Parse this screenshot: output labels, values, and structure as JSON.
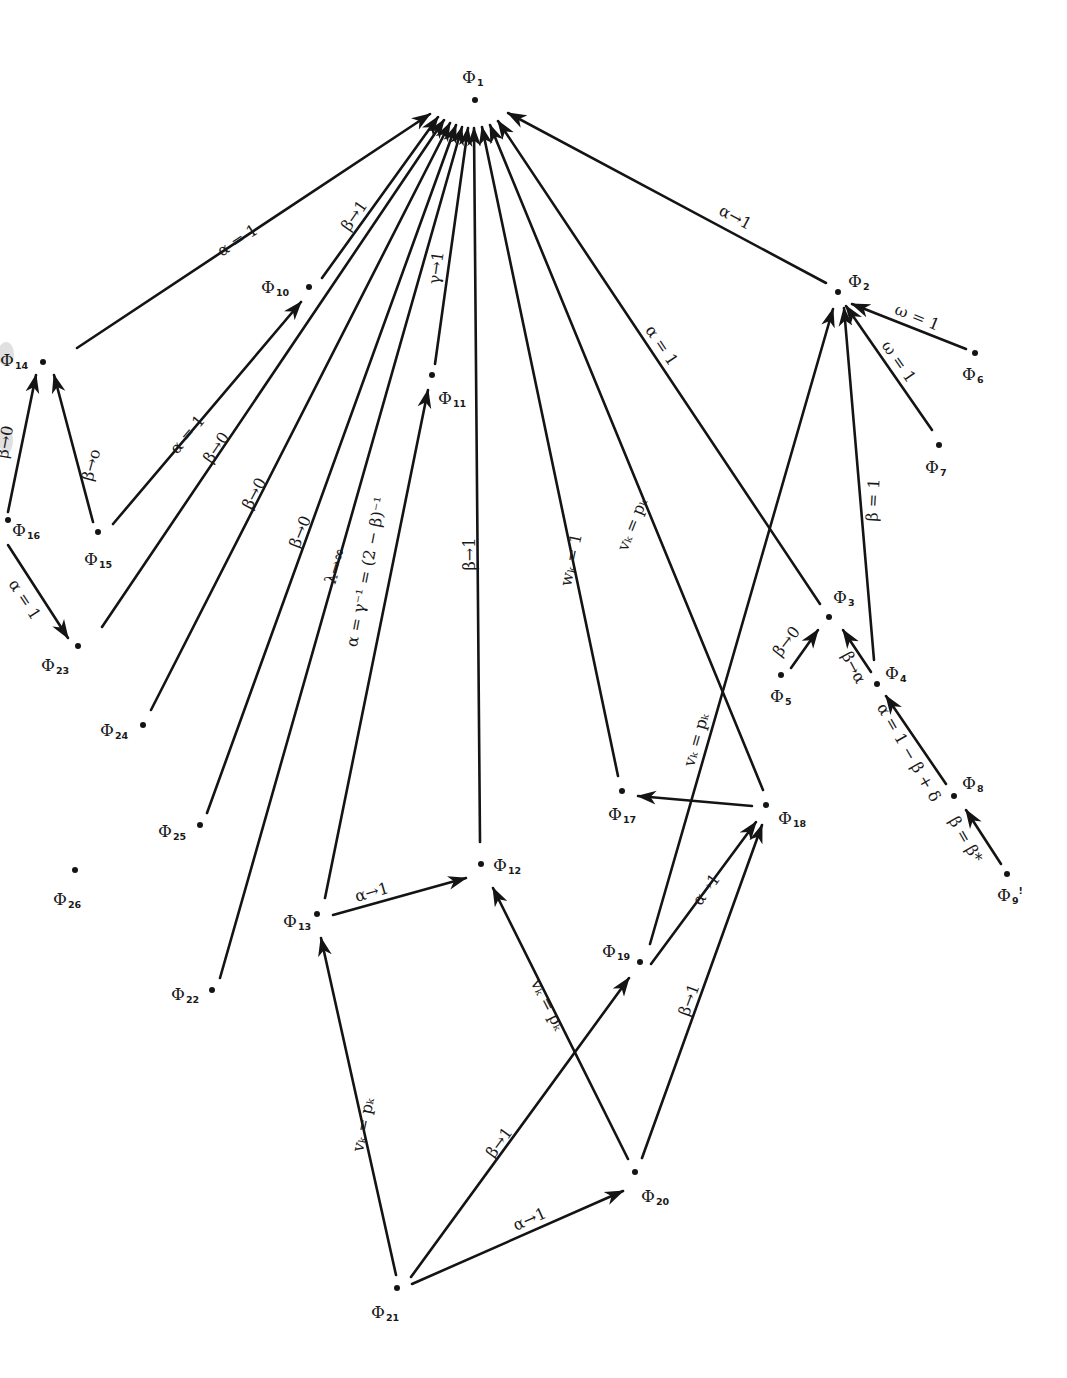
{
  "diagram": {
    "colors": {
      "ink": "#141414",
      "background": "#ffffff"
    },
    "nodes": [
      {
        "id": "1",
        "symbol": "Φ",
        "sub": "1",
        "x": 475,
        "y": 100,
        "lx": 462,
        "ly": 78,
        "lpos": "above"
      },
      {
        "id": "2",
        "symbol": "Φ",
        "sub": "2",
        "x": 838,
        "y": 292,
        "lx": 848,
        "ly": 282
      },
      {
        "id": "3",
        "symbol": "Φ",
        "sub": "3",
        "x": 829,
        "y": 617,
        "lx": 833,
        "ly": 598
      },
      {
        "id": "4",
        "symbol": "Φ",
        "sub": "4",
        "x": 877,
        "y": 684,
        "lx": 885,
        "ly": 674
      },
      {
        "id": "5",
        "symbol": "Φ",
        "sub": "5",
        "x": 781,
        "y": 675,
        "lx": 770,
        "ly": 697
      },
      {
        "id": "6",
        "symbol": "Φ",
        "sub": "6",
        "x": 975,
        "y": 353,
        "lx": 962,
        "ly": 375
      },
      {
        "id": "7",
        "symbol": "Φ",
        "sub": "7",
        "x": 939,
        "y": 445,
        "lx": 925,
        "ly": 468
      },
      {
        "id": "8",
        "symbol": "Φ",
        "sub": "8",
        "x": 954,
        "y": 796,
        "lx": 962,
        "ly": 784
      },
      {
        "id": "9",
        "symbol": "Φ",
        "sub": "9",
        "x": 1007,
        "y": 874,
        "lx": 997,
        "ly": 896,
        "suffix": "!"
      },
      {
        "id": "10",
        "symbol": "Φ",
        "sub": "10",
        "x": 309,
        "y": 287,
        "lx": 261,
        "ly": 288
      },
      {
        "id": "11",
        "symbol": "Φ",
        "sub": "11",
        "x": 432,
        "y": 375,
        "lx": 438,
        "ly": 399
      },
      {
        "id": "12",
        "symbol": "Φ",
        "sub": "12",
        "x": 481,
        "y": 864,
        "lx": 493,
        "ly": 866
      },
      {
        "id": "13",
        "symbol": "Φ",
        "sub": "13",
        "x": 317,
        "y": 914,
        "lx": 283,
        "ly": 922
      },
      {
        "id": "14",
        "symbol": "Φ",
        "sub": "14",
        "x": 43,
        "y": 362,
        "lx": 0,
        "ly": 361
      },
      {
        "id": "15",
        "symbol": "Φ",
        "sub": "15",
        "x": 98,
        "y": 532,
        "lx": 84,
        "ly": 560
      },
      {
        "id": "16",
        "symbol": "Φ",
        "sub": "16",
        "x": 8,
        "y": 520,
        "lx": 12,
        "ly": 531
      },
      {
        "id": "17",
        "symbol": "Φ",
        "sub": "17",
        "x": 622,
        "y": 791,
        "lx": 608,
        "ly": 815
      },
      {
        "id": "18",
        "symbol": "Φ",
        "sub": "18",
        "x": 766,
        "y": 805,
        "lx": 778,
        "ly": 819
      },
      {
        "id": "19",
        "symbol": "Φ",
        "sub": "19",
        "x": 640,
        "y": 962,
        "lx": 602,
        "ly": 952
      },
      {
        "id": "20",
        "symbol": "Φ",
        "sub": "20",
        "x": 635,
        "y": 1172,
        "lx": 641,
        "ly": 1197
      },
      {
        "id": "21",
        "symbol": "Φ",
        "sub": "21",
        "x": 397,
        "y": 1288,
        "lx": 371,
        "ly": 1313
      },
      {
        "id": "22",
        "symbol": "Φ",
        "sub": "22",
        "x": 212,
        "y": 990,
        "lx": 171,
        "ly": 995
      },
      {
        "id": "23",
        "symbol": "Φ",
        "sub": "23",
        "x": 78,
        "y": 646,
        "lx": 41,
        "ly": 666
      },
      {
        "id": "24",
        "symbol": "Φ",
        "sub": "24",
        "x": 143,
        "y": 725,
        "lx": 100,
        "ly": 731
      },
      {
        "id": "25",
        "symbol": "Φ",
        "sub": "25",
        "x": 200,
        "y": 825,
        "lx": 158,
        "ly": 832
      },
      {
        "id": "26",
        "symbol": "Φ",
        "sub": "26",
        "x": 75,
        "y": 870,
        "lx": 53,
        "ly": 900
      }
    ],
    "edges": [
      {
        "from": "14",
        "to": "1",
        "x1": 77,
        "y1": 348,
        "x2": 430,
        "y2": 114,
        "arrow": true,
        "label": "α = 1",
        "lx": 238,
        "ly": 241,
        "angle": -33
      },
      {
        "from": "10",
        "to": "1",
        "x1": 322,
        "y1": 278,
        "x2": 438,
        "y2": 117,
        "arrow": true,
        "label": "β→1",
        "lx": 355,
        "ly": 216,
        "angle": -55
      },
      {
        "from": "15",
        "to": "10",
        "x1": 113,
        "y1": 524,
        "x2": 301,
        "y2": 302,
        "arrow": true,
        "label": "α = 1",
        "lx": 188,
        "ly": 435,
        "angle": -50
      },
      {
        "from": "23",
        "to": "1",
        "x1": 102,
        "y1": 627,
        "x2": 444,
        "y2": 120,
        "arrow": true,
        "label": "β→0",
        "lx": 217,
        "ly": 448,
        "angle": -56
      },
      {
        "from": "24",
        "to": "1",
        "x1": 151,
        "y1": 710,
        "x2": 450,
        "y2": 123,
        "arrow": true,
        "label": "β→0",
        "lx": 255,
        "ly": 494,
        "angle": -62
      },
      {
        "from": "25",
        "to": "1",
        "x1": 207,
        "y1": 813,
        "x2": 456,
        "y2": 125,
        "arrow": true,
        "label": "β→0",
        "lx": 301,
        "ly": 532,
        "angle": -68
      },
      {
        "from": "22",
        "to": "1",
        "x1": 220,
        "y1": 978,
        "x2": 462,
        "y2": 127,
        "arrow": true,
        "label": "λ→∞",
        "lx": 336,
        "ly": 566,
        "angle": -73
      },
      {
        "from": "11",
        "to": "1",
        "x1": 435,
        "y1": 364,
        "x2": 468,
        "y2": 128,
        "arrow": true,
        "label": "γ→1",
        "lx": 437,
        "ly": 268,
        "angle": -82
      },
      {
        "from": "13",
        "to": "11",
        "x1": 325,
        "y1": 898,
        "x2": 428,
        "y2": 390,
        "arrow": true,
        "label": "α = γ⁻¹ = (2 − β)⁻¹",
        "lx": 367,
        "ly": 572,
        "angle": -79
      },
      {
        "from": "12",
        "to": "1",
        "x1": 480,
        "y1": 842,
        "x2": 474,
        "y2": 128,
        "arrow": true,
        "label": "β→1",
        "lx": 470,
        "ly": 554,
        "angle": -90
      },
      {
        "from": "17",
        "to": "1",
        "x1": 618,
        "y1": 776,
        "x2": 482,
        "y2": 127,
        "arrow": true,
        "label": "wₖ = 1",
        "lx": 572,
        "ly": 560,
        "angle": -78
      },
      {
        "from": "18",
        "to": "1",
        "x1": 763,
        "y1": 790,
        "x2": 490,
        "y2": 125,
        "arrow": true,
        "label": "vₖ = pₖ",
        "lx": 633,
        "ly": 525,
        "angle": -68
      },
      {
        "from": "3",
        "to": "1",
        "x1": 820,
        "y1": 604,
        "x2": 498,
        "y2": 121,
        "arrow": true,
        "label": "α = 1",
        "lx": 661,
        "ly": 346,
        "angle": 56
      },
      {
        "from": "2",
        "to": "1",
        "x1": 826,
        "y1": 283,
        "x2": 508,
        "y2": 113,
        "arrow": true,
        "label": "α→1",
        "lx": 735,
        "ly": 218,
        "angle": 28
      },
      {
        "from": "6",
        "to": "2",
        "x1": 966,
        "y1": 349,
        "x2": 852,
        "y2": 304,
        "arrow": true,
        "label": "ω = 1",
        "lx": 917,
        "ly": 318,
        "angle": 22
      },
      {
        "from": "7",
        "to": "2",
        "x1": 932,
        "y1": 430,
        "x2": 846,
        "y2": 306,
        "arrow": true,
        "label": "ω = 1",
        "lx": 898,
        "ly": 362,
        "angle": 55
      },
      {
        "from": "4",
        "to": "2",
        "x1": 874,
        "y1": 660,
        "x2": 844,
        "y2": 308,
        "arrow": true,
        "label": "β = 1",
        "lx": 874,
        "ly": 500,
        "angle": -87
      },
      {
        "from": "19",
        "to": "2",
        "x1": 650,
        "y1": 944,
        "x2": 833,
        "y2": 309,
        "arrow": true,
        "label": "vₖ = pₖ",
        "lx": 697,
        "ly": 740,
        "angle": -74
      },
      {
        "from": "5",
        "to": "3",
        "x1": 791,
        "y1": 668,
        "x2": 818,
        "y2": 630,
        "arrow": true,
        "label": "β→0",
        "lx": 787,
        "ly": 642,
        "angle": -52
      },
      {
        "from": "4",
        "to": "3",
        "x1": 871,
        "y1": 672,
        "x2": 843,
        "y2": 630,
        "arrow": true,
        "label": "β→α",
        "lx": 853,
        "ly": 668,
        "angle": 62
      },
      {
        "from": "8",
        "to": "4",
        "x1": 946,
        "y1": 784,
        "x2": 886,
        "y2": 696,
        "arrow": true,
        "label": "α = 1 − β + δ",
        "lx": 908,
        "ly": 753,
        "angle": 60
      },
      {
        "from": "9",
        "to": "8",
        "x1": 1001,
        "y1": 864,
        "x2": 966,
        "y2": 810,
        "arrow": true,
        "label": "β = β*",
        "lx": 965,
        "ly": 840,
        "angle": 60
      },
      {
        "from": "16",
        "to": "14",
        "x1": 8,
        "y1": 512,
        "x2": 36,
        "y2": 375,
        "arrow": true,
        "label": "β→0",
        "lx": 6,
        "ly": 442,
        "angle": -80
      },
      {
        "from": "15",
        "to": "14",
        "x1": 93,
        "y1": 522,
        "x2": 54,
        "y2": 375,
        "arrow": true,
        "label": "β→o",
        "lx": 92,
        "ly": 465,
        "angle": -75
      },
      {
        "from": "16",
        "to": "23",
        "x1": 8,
        "y1": 545,
        "x2": 68,
        "y2": 638,
        "arrow": true,
        "label": "α = 1",
        "lx": 24,
        "ly": 600,
        "angle": 57
      },
      {
        "from": "13",
        "to": "12",
        "x1": 333,
        "y1": 915,
        "x2": 466,
        "y2": 878,
        "arrow": true,
        "label": "α→1",
        "lx": 372,
        "ly": 893,
        "angle": -16
      },
      {
        "from": "18",
        "to": "17",
        "x1": 752,
        "y1": 806,
        "x2": 638,
        "y2": 796,
        "arrow": true,
        "label": "",
        "lx": 0,
        "ly": 0,
        "angle": 0
      },
      {
        "from": "19",
        "to": "18",
        "x1": 651,
        "y1": 964,
        "x2": 756,
        "y2": 822,
        "arrow": true,
        "label": "α→1",
        "lx": 707,
        "ly": 890,
        "angle": -54
      },
      {
        "from": "20",
        "to": "18",
        "x1": 642,
        "y1": 1158,
        "x2": 762,
        "y2": 825,
        "arrow": true,
        "label": "β→1",
        "lx": 690,
        "ly": 1000,
        "angle": -70
      },
      {
        "from": "20",
        "to": "12",
        "x1": 628,
        "y1": 1159,
        "x2": 493,
        "y2": 888,
        "arrow": true,
        "label": "vₖ = pₖ",
        "lx": 547,
        "ly": 1005,
        "angle": 63
      },
      {
        "from": "21",
        "to": "13",
        "x1": 396,
        "y1": 1275,
        "x2": 321,
        "y2": 938,
        "arrow": true,
        "label": "vₖ = pₖ",
        "lx": 364,
        "ly": 1125,
        "angle": -78
      },
      {
        "from": "21",
        "to": "19",
        "x1": 411,
        "y1": 1277,
        "x2": 629,
        "y2": 978,
        "arrow": true,
        "label": "β→1",
        "lx": 500,
        "ly": 1143,
        "angle": -54
      },
      {
        "from": "21",
        "to": "20",
        "x1": 412,
        "y1": 1284,
        "x2": 623,
        "y2": 1191,
        "arrow": true,
        "label": "α→1",
        "lx": 530,
        "ly": 1220,
        "angle": -24
      }
    ]
  }
}
